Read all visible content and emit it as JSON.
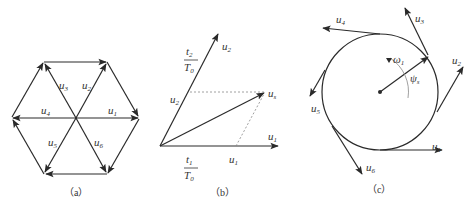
{
  "panels": {
    "a": {
      "caption": "（a）",
      "labels": {
        "u1": {
          "base": "u",
          "sub": "1"
        },
        "u2": {
          "base": "u",
          "sub": "2"
        },
        "u3": {
          "base": "u",
          "sub": "3"
        },
        "u4": {
          "base": "u",
          "sub": "4"
        },
        "u5": {
          "base": "u",
          "sub": "5"
        },
        "u6": {
          "base": "u",
          "sub": "6"
        }
      }
    },
    "b": {
      "caption": "（b）",
      "labels": {
        "u1": {
          "base": "u",
          "sub": "1"
        },
        "u2": {
          "base": "u",
          "sub": "2"
        },
        "us": {
          "base": "u",
          "sub": "s"
        },
        "u1_prime": {
          "base": "u",
          "sub": "1"
        },
        "u2_prime": {
          "base": "u",
          "sub": "2"
        },
        "t1_num": {
          "base": "t",
          "sub": "1"
        },
        "t2_num": {
          "base": "t",
          "sub": "2"
        },
        "T0_den": {
          "base": "T",
          "sub": "0"
        }
      }
    },
    "c": {
      "caption": "（c）",
      "labels": {
        "u1": {
          "base": "u",
          "sub": "1"
        },
        "u2": {
          "base": "u",
          "sub": "2"
        },
        "u3": {
          "base": "u",
          "sub": "3"
        },
        "u4": {
          "base": "u",
          "sub": "4"
        },
        "u5": {
          "base": "u",
          "sub": "5"
        },
        "u6": {
          "base": "u",
          "sub": "6"
        },
        "omega": {
          "base": "ω",
          "sub": "1"
        },
        "psi": {
          "base": "ψ",
          "sub": "s"
        }
      }
    }
  },
  "colors": {
    "stroke": "#2a2a2a",
    "dashed": "#888888",
    "background": "#ffffff"
  }
}
